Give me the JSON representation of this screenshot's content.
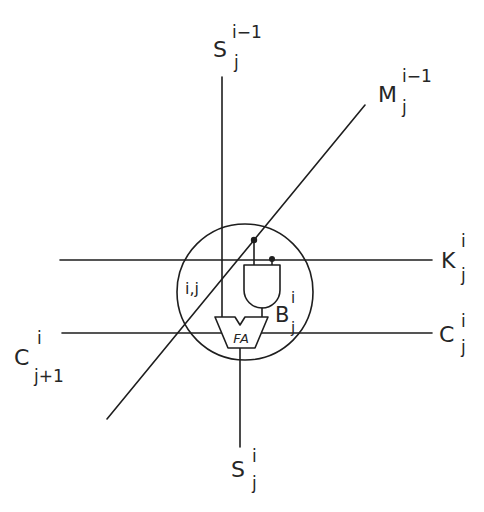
{
  "diagram": {
    "labels": {
      "s_top": {
        "base": "S",
        "sup": "i−1",
        "sub": "j"
      },
      "m": {
        "base": "M",
        "sup": "i−1",
        "sub": "j"
      },
      "k": {
        "base": "K",
        "sup": "i",
        "sub": "j"
      },
      "c_right": {
        "base": "C",
        "sup": "i",
        "sub": "j"
      },
      "c_left": {
        "base": "C",
        "sup": "i",
        "sub": "j+1"
      },
      "s_bottom": {
        "base": "S",
        "sup": "i",
        "sub": "j"
      },
      "b": {
        "base": "B",
        "sup": "i",
        "sub": "j"
      },
      "cell": "i,j",
      "fa": "FA"
    },
    "components": [
      "full-adder",
      "and-gate",
      "cell-boundary-circle"
    ],
    "colors": {
      "stroke": "#1e1e1e",
      "background": "#ffffff"
    }
  }
}
